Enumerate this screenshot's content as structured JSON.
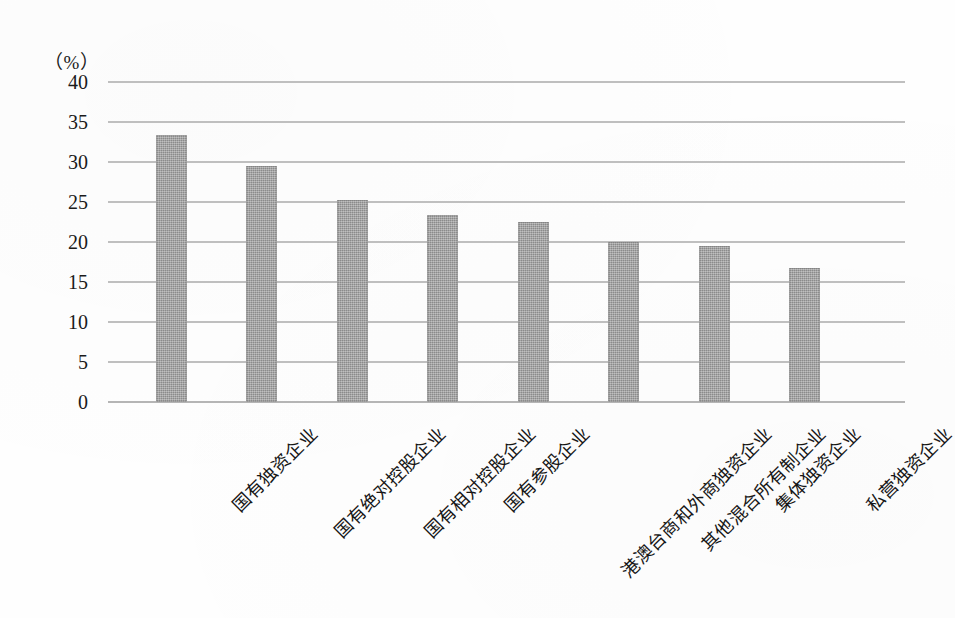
{
  "chart_data": {
    "type": "bar",
    "title": "",
    "subtitle": "",
    "xlabel": "",
    "ylabel": "",
    "unit_label": "（%）",
    "categories": [
      "国有独资企业",
      "国有绝对控股企业",
      "国有相对控股企业",
      "国有参股企业",
      "港澳台商和外商独资企业",
      "其他混合所有制企业",
      "集体独资企业",
      "私营独资企业"
    ],
    "values": [
      33.4,
      29.5,
      25.3,
      23.4,
      22.5,
      20.0,
      19.5,
      16.8
    ],
    "ylim": [
      0,
      40
    ],
    "ytick_labels": [
      "0",
      "5",
      "10",
      "15",
      "20",
      "25",
      "30",
      "35",
      "40"
    ],
    "ytick_values": [
      0,
      5,
      10,
      15,
      20,
      25,
      30,
      35,
      40
    ],
    "grid": true,
    "grid_orientation": "horizontal",
    "legend": false,
    "legend_position": "none",
    "bar_color": "#9b9b9b",
    "grid_color": "#b4b4b4",
    "text_color": "#1a1a1a",
    "xlabel_rotation": -45
  }
}
